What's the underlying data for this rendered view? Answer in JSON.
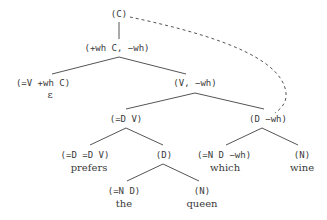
{
  "tree": {
    "root": {
      "label": "(C)"
    },
    "n1": {
      "label": "(+wh C, −wh)"
    },
    "n2": {
      "label": "(=V +wh C)",
      "word": "ε"
    },
    "n3": {
      "label": "(V, −wh)"
    },
    "n4": {
      "label": "(=D V)"
    },
    "n5": {
      "label": "(D −wh)"
    },
    "n6": {
      "label": "(=D =D V)",
      "word": "prefers"
    },
    "n7": {
      "label": "(D)"
    },
    "n8": {
      "label": "(=N D −wh)",
      "word": "which"
    },
    "n9": {
      "label": "(N)",
      "word": "wine"
    },
    "n10": {
      "label": "(=N D)",
      "word": "the"
    },
    "n11": {
      "label": "(N)",
      "word": "queen"
    }
  },
  "colors": {
    "line": "#555555",
    "text": "#3a3a3a"
  }
}
